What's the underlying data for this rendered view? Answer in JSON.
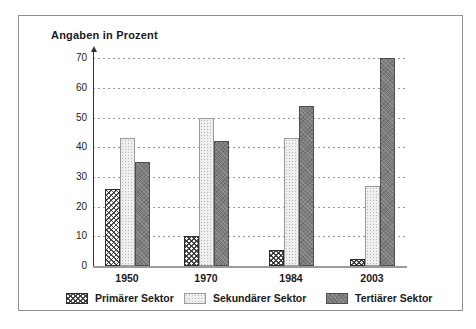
{
  "title": "Angaben in Prozent",
  "chart_data": {
    "type": "bar",
    "title": "Angaben in Prozent",
    "categories": [
      "1950",
      "1970",
      "1984",
      "2003"
    ],
    "series": [
      {
        "name": "Primärer Sektor",
        "pattern": "diamond-hatch",
        "values": [
          26,
          10,
          5.5,
          2.5
        ]
      },
      {
        "name": "Sekundärer Sektor",
        "pattern": "light-dots",
        "values": [
          43,
          50,
          43,
          27
        ]
      },
      {
        "name": "Tertiärer Sektor",
        "pattern": "dark-gray",
        "values": [
          35,
          42,
          54,
          70
        ]
      }
    ],
    "ylabel": "Angaben in Prozent",
    "ylim": [
      0,
      70
    ],
    "yticks": [
      0,
      10,
      20,
      30,
      40,
      50,
      60,
      70
    ],
    "grid": "horizontal-dashed",
    "legend_position": "bottom"
  },
  "colors": {
    "tertiary_fill": "#7d7d7d",
    "grid_line": "#9a9a9a",
    "axis_line": "#333333",
    "frame_border": "#8f8f8f",
    "text": "#1a1a1a"
  }
}
